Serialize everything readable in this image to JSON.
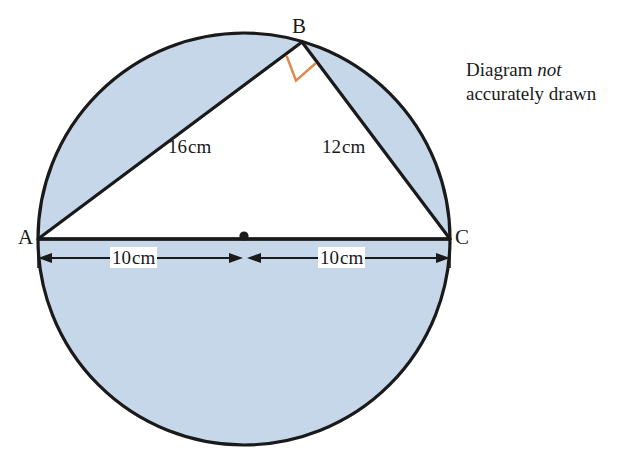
{
  "figure": {
    "type": "circle-with-inscribed-right-triangle",
    "note": {
      "line1_prefix": "Diagram ",
      "line1_emphasis": "not",
      "line2": "accurately drawn"
    },
    "vertices": [
      {
        "name": "A",
        "label": "A",
        "x": 38,
        "y": 239
      },
      {
        "name": "B",
        "label": "B",
        "x": 302,
        "y": 42
      },
      {
        "name": "C",
        "label": "C",
        "x": 450,
        "y": 239
      }
    ],
    "center_point": {
      "name": "O",
      "x": 244,
      "y": 239
    },
    "circle": {
      "cx": 244,
      "cy": 239,
      "r": 206
    },
    "sides": [
      {
        "name": "AB",
        "label": "16",
        "unit": "cm",
        "from": "A",
        "to": "B"
      },
      {
        "name": "BC",
        "label": "12",
        "unit": "cm",
        "from": "B",
        "to": "C"
      }
    ],
    "radii_dimensions": [
      {
        "name": "A-to-centre",
        "label": "10",
        "unit": "cm"
      },
      {
        "name": "centre-to-C",
        "label": "10",
        "unit": "cm"
      }
    ],
    "right_angle": {
      "at": "B",
      "marker": "square",
      "color": "#E08A50"
    },
    "colors": {
      "shaded_fill": "#c6d7ea",
      "triangle_fill": "#ffffff",
      "stroke": "#1a1a1a",
      "right_angle": "#E08A50",
      "text": "#1a1a1a"
    }
  }
}
